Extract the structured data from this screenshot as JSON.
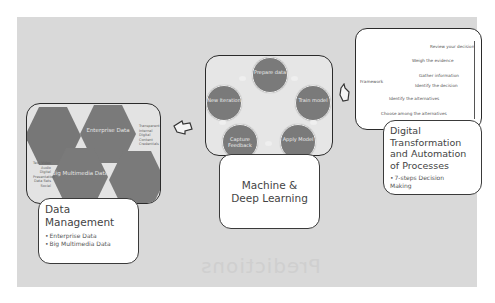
{
  "background_text": "Predictions",
  "data_management": {
    "title": "Data Management",
    "bullets": [
      "Enterprise Data",
      "Big Multimedia Data"
    ],
    "hexagons": [
      {
        "label": ""
      },
      {
        "label": "Enterprise Data"
      },
      {
        "label": "Big Multimedia Data"
      },
      {
        "label": ""
      }
    ],
    "side_notes_right": "Transparent Internal Digital Content Credentials",
    "side_notes_left": "Text Video Audio Digital Presentation Data Sets Social"
  },
  "ml": {
    "title": "Machine & Deep Learning",
    "cycle": [
      {
        "label": "Prepare data"
      },
      {
        "label": "Train model"
      },
      {
        "label": "Apply Model"
      },
      {
        "label": "Capture Feedback"
      },
      {
        "label": "New Iteration"
      }
    ]
  },
  "automation": {
    "title": "Digital Transformation and Automation of Processes",
    "bullets": [
      "7-steps Decision Making"
    ],
    "left_label": "Framework",
    "steps": [
      "Review your decision",
      "Weigh the evidence",
      "Gather information",
      "Identify the decision",
      "Identify the alternatives",
      "Choose among the alternatives"
    ]
  },
  "colors": {
    "panel": "#d9d9d9",
    "shape_fill": "#7a7a7a",
    "border": "#2b2b2b"
  }
}
